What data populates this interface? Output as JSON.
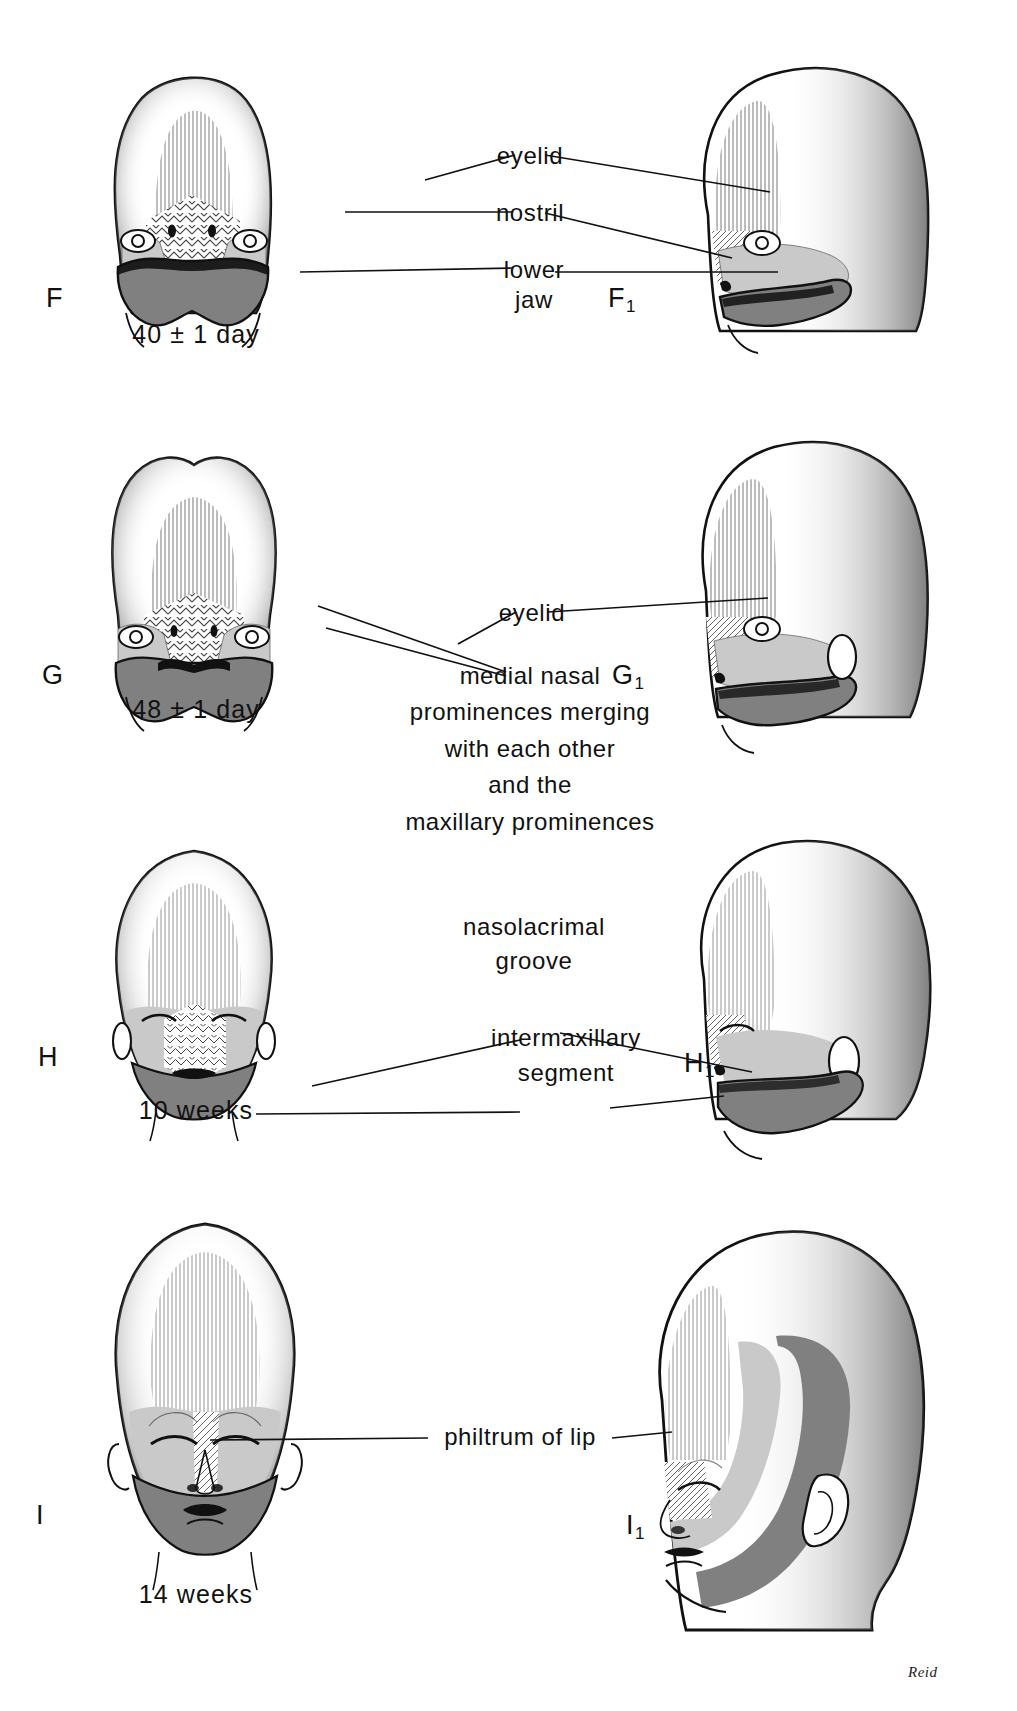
{
  "plate": {
    "title": "Development of the human face",
    "signature": "Reid",
    "colors": {
      "ink": "#111111",
      "maxillary_light_gray": "#c9c9c9",
      "mandibular_dark_gray": "#808080",
      "paper": "#ffffff",
      "stipple": "#222222"
    }
  },
  "panels": [
    {
      "id": "F",
      "frontal_letter": "F",
      "profile_letter": "F",
      "profile_letter_sub": "1",
      "stage_caption": "40 ± 1 day",
      "view_frontal": "frontal view of embryonic face",
      "view_profile": "lateral (profile) view of embryonic face",
      "labels": [
        {
          "text": "eyelid",
          "name": "eyelid"
        },
        {
          "text": "nostril",
          "name": "nostril"
        },
        {
          "text": "lower",
          "name": "lower-jaw-line1"
        },
        {
          "text": "jaw",
          "name": "lower-jaw-line2"
        }
      ]
    },
    {
      "id": "G",
      "frontal_letter": "G",
      "profile_letter": "G",
      "profile_letter_sub": "1",
      "stage_caption": "48 ± 1 day",
      "view_frontal": "frontal view of embryonic face",
      "view_profile": "lateral (profile) view of embryonic face",
      "labels": [
        {
          "text": "eyelid",
          "name": "eyelid"
        },
        {
          "text": "medial  nasal",
          "name": "medial-nasal-line1"
        },
        {
          "text": "prominences merging",
          "name": "medial-nasal-line2"
        },
        {
          "text": "with each other",
          "name": "medial-nasal-line3"
        },
        {
          "text": "and the",
          "name": "medial-nasal-line4"
        },
        {
          "text": "maxillary  prominences",
          "name": "medial-nasal-line5"
        }
      ]
    },
    {
      "id": "H",
      "frontal_letter": "H",
      "profile_letter": "H",
      "profile_letter_sub": "1",
      "stage_caption": "10 weeks",
      "view_frontal": "frontal view of fetal face",
      "view_profile": "lateral (profile) view of fetal face",
      "labels": [
        {
          "text": "nasolacrimal",
          "name": "nasolacrimal-groove-line1"
        },
        {
          "text": "groove",
          "name": "nasolacrimal-groove-line2"
        },
        {
          "text": "intermaxillary",
          "name": "intermaxillary-segment-line1"
        },
        {
          "text": "segment",
          "name": "intermaxillary-segment-line2"
        }
      ]
    },
    {
      "id": "I",
      "frontal_letter": "I",
      "profile_letter": "I",
      "profile_letter_sub": "1",
      "stage_caption": "14 weeks",
      "view_frontal": "frontal view of fetal face",
      "view_profile": "lateral (profile) view of fetal face",
      "labels": [
        {
          "text": "philtrum of lip",
          "name": "philtrum-of-lip"
        }
      ]
    }
  ]
}
